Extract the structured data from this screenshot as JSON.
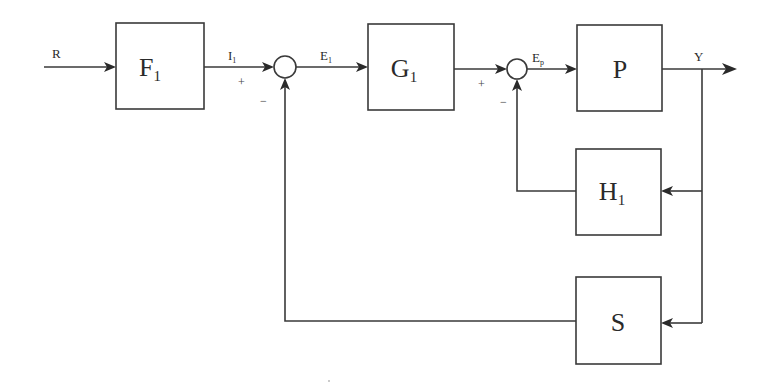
{
  "diagram": {
    "title": "",
    "type": "control-system-block-diagram",
    "colors": {
      "stroke": "#3a3a3a",
      "background": "#ffffff",
      "text": "#2a2a2a"
    },
    "blocks": {
      "F1": {
        "label": "F",
        "sub": "1"
      },
      "G1": {
        "label": "G",
        "sub": "1"
      },
      "P": {
        "label": "P",
        "sub": ""
      },
      "H1": {
        "label": "H",
        "sub": "1"
      },
      "S": {
        "label": "S",
        "sub": ""
      }
    },
    "signals": {
      "R": {
        "label": "R",
        "sub": ""
      },
      "I1": {
        "label": "I",
        "sub": "1"
      },
      "E1": {
        "label": "E",
        "sub": "1"
      },
      "Ep": {
        "label": "E",
        "sub": "p"
      },
      "Y": {
        "label": "Y",
        "sub": ""
      }
    },
    "junctions": {
      "sum1": {
        "plus": "+",
        "minus": "−"
      },
      "sum2": {
        "plus": "+",
        "minus": "−"
      }
    },
    "connections": [
      {
        "from": "R",
        "to": "F1"
      },
      {
        "from": "F1",
        "to": "sum1",
        "signal": "I1",
        "sign": "+"
      },
      {
        "from": "sum1",
        "to": "G1",
        "signal": "E1"
      },
      {
        "from": "G1",
        "to": "sum2",
        "sign": "+"
      },
      {
        "from": "sum2",
        "to": "P",
        "signal": "Ep"
      },
      {
        "from": "P",
        "to": "output",
        "signal": "Y"
      },
      {
        "from": "Y",
        "to": "H1"
      },
      {
        "from": "H1",
        "to": "sum2",
        "sign": "−"
      },
      {
        "from": "Y",
        "to": "S"
      },
      {
        "from": "S",
        "to": "sum1",
        "sign": "−"
      }
    ]
  }
}
